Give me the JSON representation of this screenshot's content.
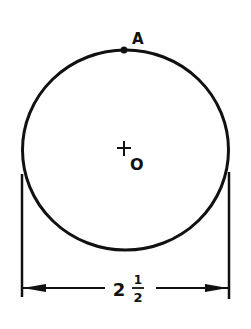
{
  "diagram": {
    "type": "circle-dimension",
    "point_label": "A",
    "center_label": "O",
    "dimension": {
      "whole": "2",
      "numerator": "1",
      "denominator": "2",
      "meaning": "diameter = 2 1/2"
    },
    "colors": {
      "stroke": "#111111",
      "background": "#ffffff"
    }
  }
}
